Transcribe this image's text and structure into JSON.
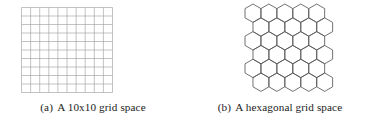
{
  "page": {
    "background_color": "#ffffff",
    "width": 373,
    "height": 125
  },
  "figure": {
    "subfigures": [
      {
        "tag": "(a)",
        "caption_text": "A 10x10 grid space",
        "caption_full": "(a) A 10x10 grid space",
        "figure_type": "square-grid",
        "line_color": "#9a9a9a",
        "line_width": 0.6,
        "columns": 10,
        "rows": 10,
        "cell_size_px": 9.1,
        "width_px": 91,
        "height_px": 85
      },
      {
        "tag": "(b)",
        "caption_text": "A hexagonal grid space",
        "caption_full": "(b) A hexagonal grid space",
        "figure_type": "hexagonal-grid",
        "line_color": "#585858",
        "line_width": 0.85,
        "orientation": "pointy-top",
        "columns": 5,
        "rows": 6,
        "hex_radius_px": 9.2,
        "width_px": 92,
        "height_px": 92
      }
    ]
  }
}
